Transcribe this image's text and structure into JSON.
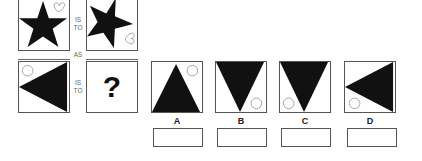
{
  "puzzle": {
    "connector_is_to": [
      "IS",
      "TO"
    ],
    "connector_as": "AS",
    "question_mark": "?",
    "cells": [
      {
        "id": "premise-1",
        "shape": "star-upright",
        "marker": "heart-top-right"
      },
      {
        "id": "premise-2",
        "shape": "star-rotated",
        "marker": "heart-bottom-right"
      },
      {
        "id": "premise-3",
        "shape": "triangle-pointing-left",
        "marker": "circle-top-left"
      },
      {
        "id": "answer-unknown",
        "shape": "question-mark"
      }
    ],
    "options": [
      {
        "label": "A",
        "shape": "triangle-pointing-up",
        "marker": "circle-top-right"
      },
      {
        "label": "B",
        "shape": "triangle-pointing-down",
        "marker": "circle-bottom-right"
      },
      {
        "label": "C",
        "shape": "triangle-pointing-down",
        "marker": "circle-bottom-left"
      },
      {
        "label": "D",
        "shape": "triangle-pointing-left",
        "marker": "circle-bottom-left"
      }
    ]
  },
  "colors": {
    "shape_fill": "#111111",
    "border": "#555555",
    "marker_stroke": "#999999"
  }
}
